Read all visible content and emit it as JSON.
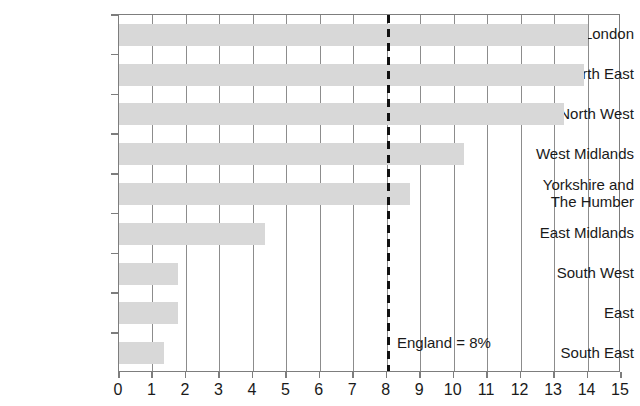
{
  "chart_data": {
    "type": "bar",
    "orientation": "horizontal",
    "title": "",
    "subtitle": "",
    "xlabel": "",
    "ylabel": "",
    "categories": [
      "London",
      "North East",
      "North West",
      "West Midlands",
      "Yorkshire and\nThe Humber",
      "East Midlands",
      "South West",
      "East",
      "South East"
    ],
    "values": [
      14.0,
      13.9,
      13.3,
      10.3,
      8.7,
      4.35,
      1.75,
      1.75,
      1.35
    ],
    "xlim": [
      0,
      15
    ],
    "xticks": [
      0,
      1,
      2,
      3,
      4,
      5,
      6,
      7,
      8,
      9,
      10,
      11,
      12,
      13,
      14,
      15
    ],
    "xtick_labels": [
      "0",
      "1",
      "2",
      "3",
      "4",
      "5",
      "6",
      "7",
      "8",
      "9",
      "10",
      "11",
      "12",
      "13",
      "14",
      "15"
    ],
    "grid": "vertical",
    "legend": "none",
    "bar_color": "#d8d8d8",
    "gridline_color": "#8c8c8c",
    "axis_color": "#7d7d7d",
    "text_color": "#1a1a1a",
    "annotations": [
      {
        "name": "england-reference-line",
        "label": "England = 8%",
        "value": 8,
        "style": "dashed",
        "color": "#111111"
      }
    ]
  }
}
